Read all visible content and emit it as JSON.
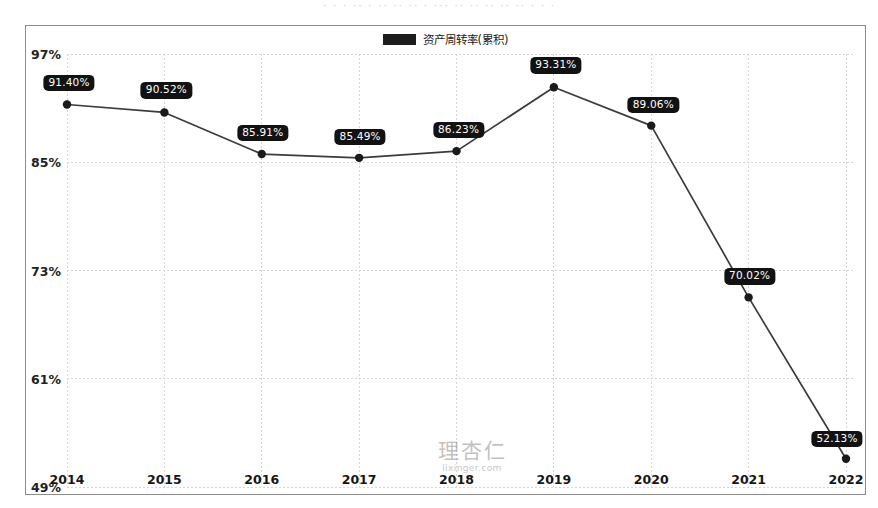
{
  "top_sliver_text": "· ·  ·  ·· ·  ·· ·· ·· ·  ··· ·· ·· ·· ·· ·· · · ·",
  "legend": {
    "label": "资产周转率(累积)",
    "swatch_color": "#1c1c1c",
    "swatch_name": "legend-color-swatch"
  },
  "watermark": {
    "mark": "理杏仁",
    "url": "lixinger.com"
  },
  "chart_data": {
    "type": "line",
    "title": "",
    "subtitle": "",
    "xlabel": "",
    "ylabel": "",
    "categories": [
      "2014",
      "2015",
      "2016",
      "2017",
      "2018",
      "2019",
      "2020",
      "2021",
      "2022"
    ],
    "x": [
      2014,
      2015,
      2016,
      2017,
      2018,
      2019,
      2020,
      2021,
      2022
    ],
    "values": [
      91.4,
      90.52,
      85.91,
      85.49,
      86.23,
      93.31,
      89.06,
      70.02,
      52.13
    ],
    "point_labels": [
      "91.40%",
      "90.52%",
      "85.91%",
      "85.49%",
      "86.23%",
      "93.31%",
      "89.06%",
      "70.02%",
      "52.13%"
    ],
    "series": [
      {
        "name": "资产周转率(累积)",
        "color": "#3b3b3b",
        "values": [
          91.4,
          90.52,
          85.91,
          85.49,
          86.23,
          93.31,
          89.06,
          70.02,
          52.13
        ]
      }
    ],
    "ylim": [
      49,
      97
    ],
    "ytick_values": [
      97,
      85,
      73,
      61,
      49
    ],
    "ytick_labels": [
      "97%",
      "85%",
      "73%",
      "61%",
      "49%"
    ],
    "xtick_labels": [
      "2014",
      "2015",
      "2016",
      "2017",
      "2018",
      "2019",
      "2020",
      "2021",
      "2022"
    ],
    "grid": true,
    "grid_style": "dotted",
    "grid_color": "#d5d5d8",
    "legend_position": "top-center",
    "marker": "filled-circle",
    "marker_color": "#1a1a1a",
    "line_color": "#3b3b3b",
    "value_suffix": "%"
  }
}
